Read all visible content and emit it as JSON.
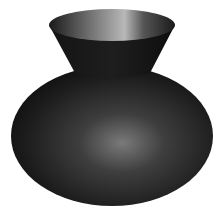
{
  "scene": {
    "subject": "vase",
    "background_color": "#ffffff",
    "body_color": "#2a2a2a",
    "highlight_color": "#8a8a8a",
    "rim_inner_highlight": "#b0b0b0"
  }
}
